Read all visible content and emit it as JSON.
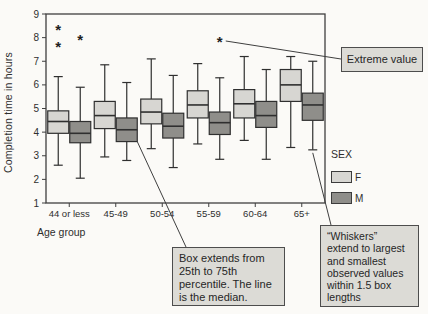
{
  "figure": {
    "ylabel": "Completion time in hours",
    "xlabel": "Age group"
  },
  "legend": {
    "title": "SEX",
    "items": [
      {
        "label": "F"
      },
      {
        "label": "M"
      }
    ]
  },
  "annotations": {
    "extreme": {
      "text": "Extreme value"
    },
    "box_note": {
      "text": "Box extends from\n25th to 75th\npercentile. The line\nis the median."
    },
    "whisker_note": {
      "text": "“Whiskers”\nextend to largest\nand smallest\nobserved values\nwithin 1.5 box\nlengths"
    }
  },
  "colors": {
    "background": "#fbfaf7",
    "frame": "#3f3f3f",
    "box_border": "#2f2f2f",
    "f_fill": "#d7d6d2",
    "m_fill": "#8f8e8a",
    "text": "#2e2e2e",
    "marker": "#1f1f1f",
    "note_fill": "#dcdbd6",
    "note_border": "#4d4d4d"
  },
  "chart_data": {
    "type": "boxplot",
    "xlabel": "Age group",
    "ylabel": "Completion time in hours",
    "ylim": [
      1,
      9
    ],
    "yticks": [
      1,
      2,
      3,
      4,
      5,
      6,
      7,
      8,
      9
    ],
    "grid": false,
    "legend_position": "right",
    "categories": [
      "44 or less",
      "45-49",
      "50-54",
      "55-59",
      "60-64",
      "65+"
    ],
    "series": [
      {
        "name": "F",
        "boxes": [
          {
            "low": 2.6,
            "q1": 3.95,
            "median": 4.45,
            "q3": 4.9,
            "high": 6.35,
            "outliers": [
              7.7,
              8.4
            ]
          },
          {
            "low": 2.95,
            "q1": 4.15,
            "median": 4.7,
            "q3": 5.3,
            "high": 6.85,
            "outliers": []
          },
          {
            "low": 3.3,
            "q1": 4.35,
            "median": 4.85,
            "q3": 5.4,
            "high": 7.1,
            "outliers": []
          },
          {
            "low": 3.5,
            "q1": 4.6,
            "median": 5.15,
            "q3": 5.75,
            "high": 6.9,
            "outliers": []
          },
          {
            "low": 3.65,
            "q1": 4.6,
            "median": 5.2,
            "q3": 5.8,
            "high": 7.2,
            "outliers": []
          },
          {
            "low": 3.35,
            "q1": 5.3,
            "median": 6.0,
            "q3": 6.65,
            "high": 7.2,
            "outliers": []
          }
        ]
      },
      {
        "name": "M",
        "boxes": [
          {
            "low": 2.05,
            "q1": 3.55,
            "median": 3.95,
            "q3": 4.45,
            "high": 5.9,
            "outliers": [
              8.0
            ]
          },
          {
            "low": 2.8,
            "q1": 3.6,
            "median": 4.1,
            "q3": 4.6,
            "high": 6.1,
            "outliers": []
          },
          {
            "low": 2.5,
            "q1": 3.75,
            "median": 4.25,
            "q3": 4.8,
            "high": 6.4,
            "outliers": []
          },
          {
            "low": 2.85,
            "q1": 3.9,
            "median": 4.4,
            "q3": 4.85,
            "high": 6.3,
            "outliers": [
              7.9
            ]
          },
          {
            "low": 2.85,
            "q1": 4.2,
            "median": 4.7,
            "q3": 5.3,
            "high": 6.65,
            "outliers": []
          },
          {
            "low": 3.25,
            "q1": 4.5,
            "median": 5.15,
            "q3": 5.65,
            "high": 7.0,
            "outliers": []
          }
        ]
      }
    ]
  }
}
